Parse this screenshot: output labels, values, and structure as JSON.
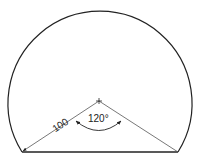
{
  "diagram": {
    "type": "circular-segment",
    "radius_label": "100",
    "angle_label": "120°",
    "colors": {
      "stroke": "#222222",
      "radius_line": "#555555",
      "background": "#ffffff"
    }
  }
}
